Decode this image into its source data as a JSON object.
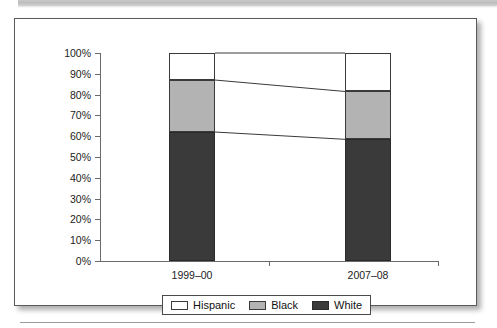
{
  "page": {
    "background_color": "#ffffff",
    "top_band_color": "#c4c4c4",
    "rule_color": "#9a9a9a"
  },
  "chart_data": {
    "type": "bar",
    "subtype": "100% stacked bar",
    "title": "",
    "xlabel": "",
    "ylabel": "",
    "categories": [
      "1999–00",
      "2007–08"
    ],
    "ylim": [
      0,
      100
    ],
    "ytick_labels": [
      "100%",
      "90%",
      "80%",
      "70%",
      "60%",
      "50%",
      "40%",
      "30%",
      "20%",
      "10%",
      "0%"
    ],
    "ytick_values": [
      100,
      90,
      80,
      70,
      60,
      50,
      40,
      30,
      20,
      10,
      0
    ],
    "grid": false,
    "legend_position": "bottom",
    "series": [
      {
        "name": "Hispanic",
        "color": "#ffffff",
        "values": [
          13,
          18.5
        ]
      },
      {
        "name": "Black",
        "color": "#b3b3b3",
        "values": [
          25,
          23
        ]
      },
      {
        "name": "White",
        "color": "#3a3a3a",
        "values": [
          62,
          58.5
        ]
      }
    ],
    "cumulative_tops": {
      "White": [
        62,
        58.5
      ],
      "Black": [
        87,
        81.5
      ],
      "Hispanic": [
        100,
        100
      ]
    },
    "connector_lines": [
      {
        "from_pct": 87,
        "to_pct": 81.5
      },
      {
        "from_pct": 62,
        "to_pct": 58.5
      }
    ]
  },
  "legend": {
    "items": [
      {
        "label": "Hispanic",
        "swatch": "swatch-hispanic"
      },
      {
        "label": "Black",
        "swatch": "swatch-black"
      },
      {
        "label": "White",
        "swatch": "swatch-white"
      }
    ]
  },
  "axis": {
    "y_labels": [
      "100%",
      "90%",
      "80%",
      "70%",
      "60%",
      "50%",
      "40%",
      "30%",
      "20%",
      "10%",
      "0%"
    ],
    "x_labels": [
      "1999–00",
      "2007–08"
    ]
  }
}
